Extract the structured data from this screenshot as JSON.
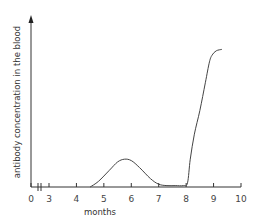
{
  "chart_data": {
    "type": "line",
    "title": "",
    "xlabel": "months",
    "ylabel": "antibody concentration in the blood",
    "xlim": [
      0,
      10
    ],
    "ylim": [
      0,
      1
    ],
    "axis_break": "between 0 and 3 on x-axis",
    "x_ticks": [
      "0",
      "3",
      "4",
      "5",
      "6",
      "7",
      "8",
      "9",
      "10"
    ],
    "grid": false,
    "series": [
      {
        "name": "antibody concentration",
        "x": [
          4.5,
          4.8,
          5.2,
          5.5,
          5.75,
          6.0,
          6.3,
          6.7,
          7.0,
          7.3,
          7.6,
          7.9,
          8.05,
          8.15,
          8.3,
          8.5,
          8.7,
          8.85,
          8.95,
          9.1,
          9.3
        ],
        "y": [
          0.0,
          0.04,
          0.12,
          0.18,
          0.2,
          0.19,
          0.14,
          0.06,
          0.02,
          0.01,
          0.01,
          0.01,
          0.03,
          0.2,
          0.38,
          0.55,
          0.75,
          0.9,
          0.95,
          0.98,
          0.99
        ]
      }
    ]
  }
}
